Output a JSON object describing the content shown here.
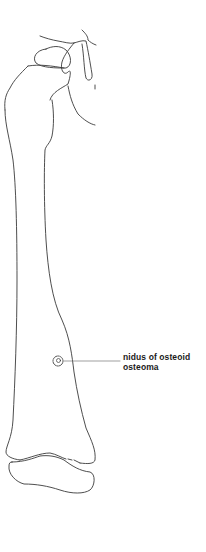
{
  "figure": {
    "stroke_color": "#3a3a3a",
    "background_color": "#ffffff"
  },
  "annotation": {
    "line1": "nidus of osteoid",
    "line2": "osteoma",
    "text_color": "#1a1a1a"
  }
}
